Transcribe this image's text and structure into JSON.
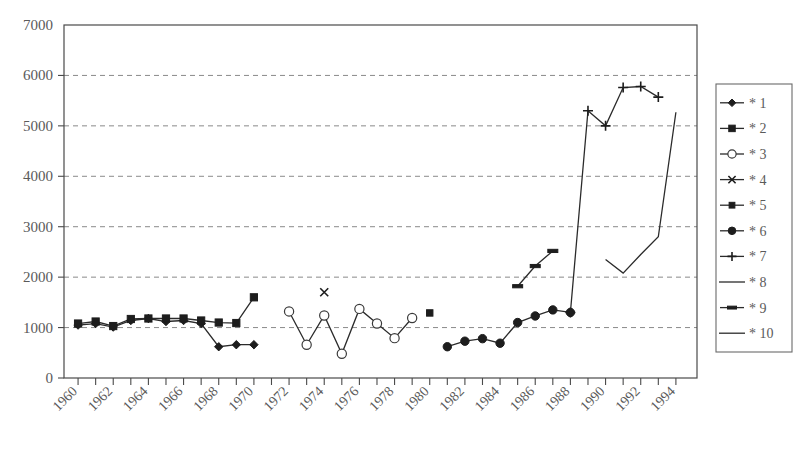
{
  "chart_data": {
    "type": "line",
    "title": "",
    "xlabel": "",
    "ylabel": "",
    "xlim": [
      1959.2,
      1995.2
    ],
    "ylim": [
      0,
      7000
    ],
    "grid": true,
    "grid_axis": "y",
    "legend_position": "right-outside",
    "y_ticks": [
      0,
      1000,
      2000,
      3000,
      4000,
      5000,
      6000,
      7000
    ],
    "y_ticklabels": [
      "0",
      "1000",
      "2000",
      "3000",
      "4000",
      "5000",
      "6000",
      "7000"
    ],
    "x_ticks": [
      1960,
      1961,
      1962,
      1963,
      1964,
      1965,
      1966,
      1967,
      1968,
      1969,
      1970,
      1971,
      1972,
      1973,
      1974,
      1975,
      1976,
      1977,
      1978,
      1979,
      1980,
      1981,
      1982,
      1983,
      1984,
      1985,
      1986,
      1987,
      1988,
      1989,
      1990,
      1991,
      1992,
      1993,
      1994
    ],
    "x_ticklabels": [
      "1960",
      "1962",
      "1964",
      "1966",
      "1968",
      "1970",
      "1972",
      "1974",
      "1976",
      "1978",
      "1980",
      "1982",
      "1984",
      "1986",
      "1988",
      "1990",
      "1992",
      "1994"
    ],
    "x_ticklabel_values": [
      1960,
      1962,
      1964,
      1966,
      1968,
      1970,
      1972,
      1974,
      1976,
      1978,
      1980,
      1982,
      1984,
      1986,
      1988,
      1990,
      1992,
      1994
    ],
    "x_ticklabel_rotation": -45,
    "series": [
      {
        "name": "* 1",
        "marker": "diamond",
        "x": [
          1960,
          1961,
          1962,
          1963,
          1964,
          1965,
          1966,
          1967,
          1968,
          1969,
          1970
        ],
        "values": [
          1050,
          1080,
          1010,
          1140,
          1180,
          1120,
          1140,
          1080,
          620,
          660,
          660
        ]
      },
      {
        "name": "* 2",
        "marker": "square",
        "x": [
          1960,
          1961,
          1962,
          1963,
          1964,
          1965,
          1966,
          1967,
          1968,
          1969,
          1970
        ],
        "values": [
          1080,
          1120,
          1030,
          1170,
          1180,
          1180,
          1180,
          1140,
          1100,
          1090,
          1600
        ]
      },
      {
        "name": "* 3",
        "marker": "open-circle",
        "x": [
          1972,
          1973,
          1974,
          1975,
          1976,
          1977,
          1978,
          1979
        ],
        "values": [
          1320,
          660,
          1240,
          480,
          1370,
          1080,
          790,
          1190
        ]
      },
      {
        "name": "* 4",
        "marker": "x-cross",
        "x": [
          1974
        ],
        "values": [
          1700
        ]
      },
      {
        "name": "* 5",
        "marker": "small-square",
        "x": [
          1980
        ],
        "values": [
          1290
        ]
      },
      {
        "name": "* 6",
        "marker": "filled-circle",
        "x": [
          1981,
          1982,
          1983,
          1984,
          1985,
          1986,
          1987,
          1988
        ],
        "values": [
          620,
          730,
          780,
          690,
          1100,
          1230,
          1350,
          1300
        ]
      },
      {
        "name": "* 7",
        "marker": "plus",
        "x": [
          1988,
          1989,
          1990,
          1991,
          1992,
          1993
        ],
        "values": [
          1300,
          5300,
          5000,
          5760,
          5780,
          5570
        ]
      },
      {
        "name": "* 8",
        "marker": "line",
        "x": [],
        "values": []
      },
      {
        "name": "* 9",
        "marker": "dash",
        "x": [
          1985,
          1986,
          1987
        ],
        "values": [
          1820,
          2220,
          2520
        ]
      },
      {
        "name": "* 10",
        "marker": "line",
        "x": [
          1990,
          1991,
          1992,
          1993,
          1994
        ],
        "values": [
          2350,
          2080,
          2450,
          2800,
          5270
        ]
      }
    ]
  },
  "legend": {
    "entries": [
      {
        "label": "* 1",
        "marker": "diamond"
      },
      {
        "label": "* 2",
        "marker": "square"
      },
      {
        "label": "* 3",
        "marker": "open-circle"
      },
      {
        "label": "* 4",
        "marker": "x-cross"
      },
      {
        "label": "* 5",
        "marker": "small-square"
      },
      {
        "label": "* 6",
        "marker": "filled-circle"
      },
      {
        "label": "* 7",
        "marker": "plus"
      },
      {
        "label": "* 8",
        "marker": "line"
      },
      {
        "label": "* 9",
        "marker": "dash"
      },
      {
        "label": "* 10",
        "marker": "line"
      }
    ]
  },
  "colors": {
    "series": "#1d1d1d",
    "grid": "#8a8a8a",
    "axis": "#4a4a4a",
    "text": "#5a5a5a",
    "background": "#ffffff"
  }
}
